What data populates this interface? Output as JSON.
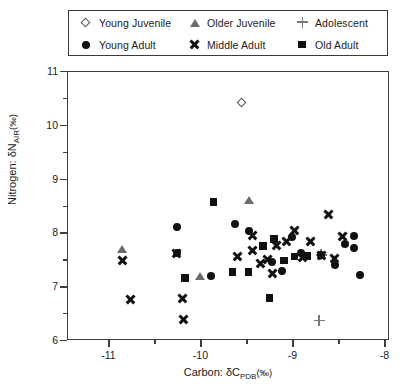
{
  "legend": {
    "entries": [
      {
        "label": "Young Juvenile",
        "marker": "diamond",
        "row": 1,
        "col": 0
      },
      {
        "label": "Older Juvenile",
        "marker": "triangle",
        "row": 1,
        "col": 1
      },
      {
        "label": "Adolescent",
        "marker": "plus",
        "row": 1,
        "col": 2
      },
      {
        "label": "Young Adult",
        "marker": "circle",
        "row": 2,
        "col": 0
      },
      {
        "label": "Middle Adult",
        "marker": "x",
        "row": 2,
        "col": 1
      },
      {
        "label": "Old Adult",
        "marker": "square",
        "row": 2,
        "col": 2
      }
    ]
  },
  "axes": {
    "y_title_parts": {
      "lead": "Nitrogen: ",
      "delta": "δN",
      "sub": "AIR",
      "unit": "(‰)"
    },
    "x_title_parts": {
      "lead": "Carbon: ",
      "delta": "δC",
      "sub": "PDB",
      "unit": "(‰)"
    },
    "y_ticks": [
      "6",
      "7",
      "8",
      "9",
      "10",
      "11"
    ],
    "x_ticks": [
      "-11",
      "-10",
      "-9",
      "-8"
    ]
  },
  "chart_data": {
    "type": "scatter",
    "title": "",
    "xlabel": "Carbon: δC_PDB(‰)",
    "ylabel": "Nitrogen: δN_AIR(‰)",
    "xlim": [
      -11.45,
      -7.95
    ],
    "ylim": [
      6,
      11
    ],
    "xticks": [
      -11,
      -10,
      -9,
      -8
    ],
    "yticks": [
      6,
      7,
      8,
      9,
      10,
      11
    ],
    "xminor": [
      -11.5,
      -10.5,
      -9.5,
      -8.5
    ],
    "yminor": [
      6.5,
      7.5,
      8.5,
      9.5,
      10.5
    ],
    "grid": false,
    "legend_position": "above-plot",
    "series": [
      {
        "name": "Young Juvenile",
        "marker": "diamond",
        "points": [
          [
            -9.55,
            10.41
          ]
        ]
      },
      {
        "name": "Older Juvenile",
        "marker": "triangle",
        "points": [
          [
            -10.86,
            7.7
          ],
          [
            -10.01,
            7.21
          ],
          [
            -9.48,
            8.62
          ]
        ]
      },
      {
        "name": "Adolescent",
        "marker": "plus",
        "points": [
          [
            -8.7,
            7.6
          ],
          [
            -8.72,
            6.38
          ]
        ]
      },
      {
        "name": "Young Adult",
        "marker": "circle",
        "points": [
          [
            -10.27,
            8.11
          ],
          [
            -10.27,
            7.63
          ],
          [
            -9.9,
            7.21
          ],
          [
            -9.63,
            8.18
          ],
          [
            -9.48,
            8.05
          ],
          [
            -9.23,
            7.47
          ],
          [
            -9.12,
            7.31
          ],
          [
            -9.02,
            7.94
          ],
          [
            -8.92,
            7.64
          ],
          [
            -8.7,
            7.6
          ],
          [
            -8.55,
            7.42
          ],
          [
            -8.44,
            7.8
          ],
          [
            -8.34,
            7.95
          ],
          [
            -8.34,
            7.72
          ],
          [
            -8.28,
            7.23
          ]
        ]
      },
      {
        "name": "Middle Adult",
        "marker": "x",
        "points": [
          [
            -10.86,
            7.5
          ],
          [
            -10.77,
            6.78
          ],
          [
            -10.27,
            7.63
          ],
          [
            -10.21,
            6.8
          ],
          [
            -10.2,
            6.41
          ],
          [
            -9.61,
            7.58
          ],
          [
            -9.45,
            7.97
          ],
          [
            -9.44,
            7.69
          ],
          [
            -9.36,
            7.44
          ],
          [
            -9.28,
            7.52
          ],
          [
            -9.23,
            7.25
          ],
          [
            -9.18,
            7.78
          ],
          [
            -9.08,
            7.86
          ],
          [
            -8.99,
            8.05
          ],
          [
            -8.9,
            7.55
          ],
          [
            -8.81,
            7.86
          ],
          [
            -8.7,
            7.6
          ],
          [
            -8.62,
            8.35
          ],
          [
            -8.55,
            7.53
          ],
          [
            -8.47,
            7.95
          ]
        ]
      },
      {
        "name": "Old Adult",
        "marker": "square",
        "points": [
          [
            -10.18,
            7.17
          ],
          [
            -9.87,
            8.58
          ],
          [
            -9.66,
            7.28
          ],
          [
            -9.49,
            7.28
          ],
          [
            -9.33,
            7.77
          ],
          [
            -9.26,
            6.8
          ],
          [
            -9.21,
            7.9
          ],
          [
            -9.1,
            7.5
          ],
          [
            -8.99,
            7.57
          ],
          [
            -8.85,
            7.58
          ]
        ]
      }
    ]
  }
}
